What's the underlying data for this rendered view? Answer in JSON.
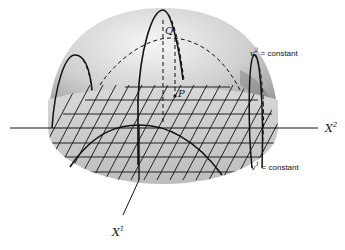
{
  "figure": {
    "axes": {
      "x1": {
        "label": "X",
        "superscript": "1"
      },
      "x2": {
        "label": "X",
        "superscript": "2"
      }
    },
    "points": {
      "Q": "Q",
      "P": "P"
    },
    "curve_labels": {
      "v2": {
        "var": "v",
        "sup": "2",
        "text": " = constant"
      },
      "v1": {
        "var": "v",
        "sup": "1",
        "text": " = constant"
      }
    },
    "colors": {
      "hemisphere_light": "#f2f2f2",
      "hemisphere_mid": "#c9c9c9",
      "hemisphere_dark": "#8e8e8e",
      "base_plane": "#d3d3d3",
      "lines": "#111111"
    }
  }
}
